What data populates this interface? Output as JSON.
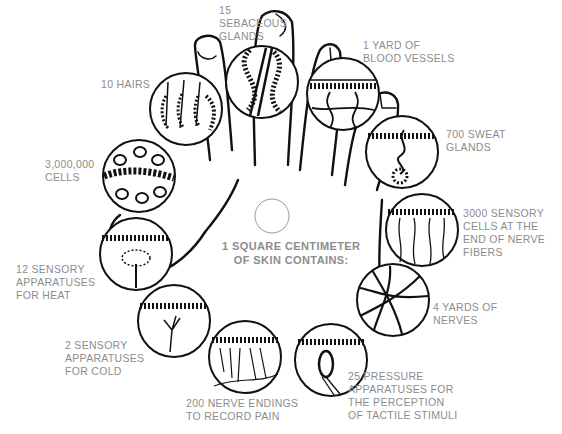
{
  "diagram": {
    "title": "1 SQUARE CENTIMETER\nOF SKIN CONTAINS:",
    "colors": {
      "ink": "#111111",
      "label": "#8c8c8c",
      "background": "#ffffff"
    },
    "center_circle": {
      "cx": 272,
      "cy": 216,
      "r": 17
    },
    "items": [
      {
        "id": "sebaceous",
        "label": "15\nSEBACEOUS\nGLANDS",
        "circle": {
          "cx": 262,
          "cy": 82,
          "r": 36
        },
        "x": 219,
        "y": 4
      },
      {
        "id": "blood",
        "label": "1 YARD OF\nBLOOD VESSELS",
        "circle": {
          "cx": 343,
          "cy": 94,
          "r": 36
        },
        "x": 363,
        "y": 39
      },
      {
        "id": "sweat",
        "label": "700 SWEAT\nGLANDS",
        "circle": {
          "cx": 402,
          "cy": 152,
          "r": 36
        },
        "x": 446,
        "y": 128
      },
      {
        "id": "sensory-cells",
        "label": "3000 SENSORY\nCELLS AT THE\nEND OF NERVE\nFIBERS",
        "circle": {
          "cx": 422,
          "cy": 230,
          "r": 36
        },
        "x": 463,
        "y": 207
      },
      {
        "id": "nerves",
        "label": "4 YARDS OF\nNERVES",
        "circle": {
          "cx": 393,
          "cy": 300,
          "r": 36
        },
        "x": 433,
        "y": 301
      },
      {
        "id": "pressure",
        "label": "25 PRESSURE\nAPPARATUSES FOR\nTHE PERCEPTION\nOF TACTILE STIMULI",
        "circle": {
          "cx": 331,
          "cy": 360,
          "r": 36
        },
        "x": 348,
        "y": 370
      },
      {
        "id": "pain",
        "label": "200 NERVE ENDINGS\nTO RECORD PAIN",
        "circle": {
          "cx": 245,
          "cy": 357,
          "r": 36
        },
        "x": 186,
        "y": 397
      },
      {
        "id": "cold",
        "label": "2 SENSORY\nAPPARATUSES\nFOR COLD",
        "circle": {
          "cx": 174,
          "cy": 321,
          "r": 36
        },
        "x": 65,
        "y": 339
      },
      {
        "id": "heat",
        "label": "12 SENSORY\nAPPARATUSES\nFOR HEAT",
        "circle": {
          "cx": 136,
          "cy": 254,
          "r": 36
        },
        "x": 16,
        "y": 263
      },
      {
        "id": "cells",
        "label": "3,000,000\nCELLS",
        "circle": {
          "cx": 139,
          "cy": 176,
          "r": 36
        },
        "x": 45,
        "y": 158
      },
      {
        "id": "hairs",
        "label": "10 HAIRS",
        "circle": {
          "cx": 186,
          "cy": 109,
          "r": 36
        },
        "x": 101,
        "y": 78
      }
    ]
  }
}
